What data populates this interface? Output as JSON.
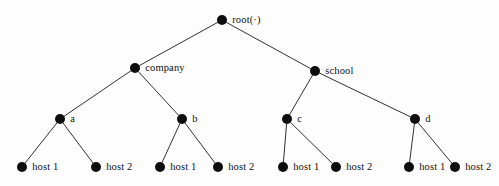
{
  "figure": {
    "background_color": "#fdfdfd",
    "node_color": "#0d0d0d",
    "edge_color": "#1a1a1a",
    "label_color": "#111111",
    "width": 499,
    "height": 186
  },
  "nodes": [
    {
      "id": "root",
      "label": "root(·)",
      "x": 222,
      "y": 20,
      "r": 5.2,
      "label_dx": 9,
      "label_dy": 0,
      "level": 0
    },
    {
      "id": "company",
      "label": "company",
      "x": 135,
      "y": 68,
      "r": 5.2,
      "label_dx": 9,
      "label_dy": 0,
      "level": 1
    },
    {
      "id": "school",
      "label": "school",
      "x": 315,
      "y": 71,
      "r": 5.2,
      "label_dx": 9,
      "label_dy": 0,
      "level": 1
    },
    {
      "id": "a",
      "label": "a",
      "x": 60,
      "y": 119,
      "r": 5.2,
      "label_dx": 9,
      "label_dy": 0,
      "level": 2
    },
    {
      "id": "b",
      "label": "b",
      "x": 182,
      "y": 119,
      "r": 5.2,
      "label_dx": 9,
      "label_dy": 0,
      "level": 2
    },
    {
      "id": "c",
      "label": "c",
      "x": 287,
      "y": 119,
      "r": 5.2,
      "label_dx": 9,
      "label_dy": 0,
      "level": 2
    },
    {
      "id": "d",
      "label": "d",
      "x": 415,
      "y": 119,
      "r": 5.2,
      "label_dx": 9,
      "label_dy": 0,
      "level": 2
    },
    {
      "id": "a-h1",
      "label": "host 1",
      "x": 22,
      "y": 167,
      "r": 5.2,
      "label_dx": 9,
      "label_dy": 0,
      "level": 3
    },
    {
      "id": "a-h2",
      "label": "host 2",
      "x": 96,
      "y": 167,
      "r": 5.2,
      "label_dx": 9,
      "label_dy": 0,
      "level": 3
    },
    {
      "id": "b-h1",
      "label": "host 1",
      "x": 160,
      "y": 167,
      "r": 5.2,
      "label_dx": 9,
      "label_dy": 0,
      "level": 3
    },
    {
      "id": "b-h2",
      "label": "host 2",
      "x": 218,
      "y": 167,
      "r": 5.2,
      "label_dx": 9,
      "label_dy": 0,
      "level": 3
    },
    {
      "id": "c-h1",
      "label": "host 1",
      "x": 283,
      "y": 167,
      "r": 5.2,
      "label_dx": 9,
      "label_dy": 0,
      "level": 3
    },
    {
      "id": "c-h2",
      "label": "host 2",
      "x": 336,
      "y": 167,
      "r": 5.2,
      "label_dx": 9,
      "label_dy": 0,
      "level": 3
    },
    {
      "id": "d-h1",
      "label": "host 1",
      "x": 409,
      "y": 167,
      "r": 5.2,
      "label_dx": 9,
      "label_dy": 0,
      "level": 3
    },
    {
      "id": "d-h2",
      "label": "host 2",
      "x": 455,
      "y": 167,
      "r": 5.2,
      "label_dx": 9,
      "label_dy": 0,
      "level": 3
    }
  ],
  "edges": [
    {
      "from": "root",
      "to": "company"
    },
    {
      "from": "root",
      "to": "school"
    },
    {
      "from": "company",
      "to": "a"
    },
    {
      "from": "company",
      "to": "b"
    },
    {
      "from": "school",
      "to": "c"
    },
    {
      "from": "school",
      "to": "d"
    },
    {
      "from": "a",
      "to": "a-h1"
    },
    {
      "from": "a",
      "to": "a-h2"
    },
    {
      "from": "b",
      "to": "b-h1"
    },
    {
      "from": "b",
      "to": "b-h2"
    },
    {
      "from": "c",
      "to": "c-h1"
    },
    {
      "from": "c",
      "to": "c-h2"
    },
    {
      "from": "d",
      "to": "d-h1"
    },
    {
      "from": "d",
      "to": "d-h2"
    }
  ]
}
